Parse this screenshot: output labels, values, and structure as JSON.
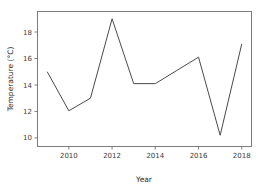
{
  "chart_data": {
    "type": "line",
    "title": "",
    "xlabel": "Year",
    "ylabel": "Temperature (°C)",
    "x": [
      2009,
      2010,
      2011,
      2012,
      2013,
      2014,
      2015,
      2016,
      2017,
      2018
    ],
    "values": [
      15.0,
      12.05,
      13.0,
      19.0,
      14.1,
      14.1,
      15.1,
      16.1,
      10.2,
      17.1
    ],
    "series": [
      {
        "name": "Temperature",
        "color": "#4a4a4a",
        "values": [
          15.0,
          12.05,
          13.0,
          19.0,
          14.1,
          14.1,
          15.1,
          16.1,
          10.2,
          17.1
        ]
      }
    ],
    "xlim": [
      2008.55,
      2018.45
    ],
    "ylim": [
      9.35,
      19.55
    ],
    "xticks": [
      2010,
      2012,
      2014,
      2016,
      2018
    ],
    "xtick_labels": [
      "2010",
      "2012",
      "2014",
      "2016",
      "2018"
    ],
    "yticks": [
      10,
      12,
      14,
      16,
      18
    ],
    "ytick_labels": [
      "10",
      "12",
      "14",
      "16",
      "18"
    ],
    "grid": false,
    "legend": null,
    "markers": false,
    "line_color": "#4a4a4a",
    "background": "#ffffff"
  },
  "axis": {
    "x_title": "Year",
    "y_title": "Temperature (°C)"
  }
}
